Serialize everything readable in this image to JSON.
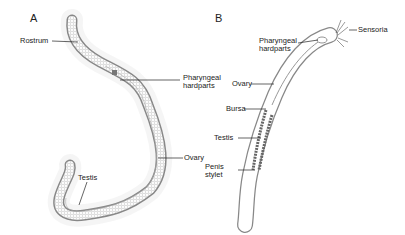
{
  "panels": [
    {
      "id": "A",
      "labels": {
        "rostrum": "Rostrum",
        "pharyngeal": "Pharyngeal",
        "hardparts": "hardparts",
        "ovary": "Ovary",
        "testis": "Testis"
      }
    },
    {
      "id": "B",
      "labels": {
        "sensoria": "Sensoria",
        "pharyngeal": "Pharyngeal",
        "hardparts": "hardparts",
        "ovary": "Ovary",
        "bursa": "Bursa",
        "testis": "Testis",
        "penis": "Penis",
        "stylet": "stylet"
      }
    }
  ],
  "colors": {
    "outline": "#777777",
    "label_line": "#222222",
    "hair": "#bbbbbb"
  }
}
